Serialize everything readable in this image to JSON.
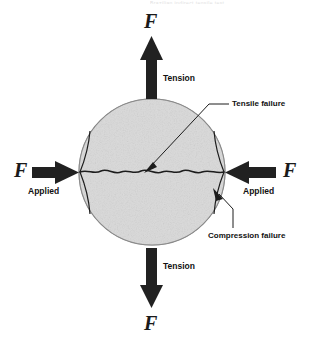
{
  "figure": {
    "title_fragment": "Brazilian indirect tensile test",
    "background_color": "#ffffff",
    "specimen": {
      "name": "rock disc specimen",
      "fill_color": "#d8d8d8",
      "edge_color": "#9a9a9a",
      "center_x": 152,
      "center_y": 172,
      "radius": 73
    },
    "forces": {
      "top": {
        "symbol": "F",
        "label": "Tension",
        "direction": "up"
      },
      "bottom": {
        "symbol": "F",
        "label": "Tension",
        "direction": "down"
      },
      "left": {
        "symbol": "F",
        "label": "Applied",
        "direction": "right"
      },
      "right": {
        "symbol": "F",
        "label": "Applied",
        "direction": "left"
      }
    },
    "annotations": [
      {
        "id": "tensile-failure",
        "label": "Tensile failure",
        "leader": "diagonal arrow to disc center"
      },
      {
        "id": "compression-failure",
        "label": "Compression failure",
        "leader": "arrow to right contact zone"
      }
    ]
  }
}
